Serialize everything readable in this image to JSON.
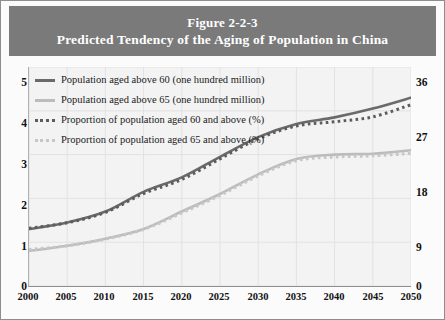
{
  "figure": {
    "number": "Figure 2-2-3",
    "title": "Predicted Tendency of the Aging of Population in China",
    "banner_color": "#7a7a7a",
    "plot_background": "#f3f3f3"
  },
  "legend": {
    "position": "top-left-inside-plot",
    "entries": [
      {
        "label": "Population aged above 60 (one hundred million)",
        "style": "solid",
        "color": "#6a6a6a",
        "axis": "left"
      },
      {
        "label": "Population aged above 65 (one hundred million)",
        "style": "solid",
        "color": "#bcbcbc",
        "axis": "left"
      },
      {
        "label": "Proportion of population aged 60 and above (%)",
        "style": "dotted",
        "color": "#5c5c5c",
        "axis": "right"
      },
      {
        "label": "Proportion of population aged 65 and above (%)",
        "style": "dotted",
        "color": "#c6c6c6",
        "axis": "right"
      }
    ]
  },
  "axes": {
    "x_ticks": [
      "2000",
      "2005",
      "2010",
      "2015",
      "2020",
      "2025",
      "2030",
      "2035",
      "2040",
      "2045",
      "2050"
    ],
    "y_left_ticks": [
      "0",
      "1",
      "2",
      "3",
      "4",
      "5"
    ],
    "y_right_ticks": [
      "0",
      "9",
      "18",
      "27",
      "36"
    ],
    "y_left_range": [
      0,
      5
    ],
    "y_right_range": [
      0,
      36
    ],
    "x_range": [
      2000,
      2050
    ],
    "grid": true
  },
  "chart_data": {
    "type": "line",
    "title": "Predicted Tendency of the Aging of Population in China",
    "subtitle": "Figure 2-2-3",
    "xlabel": "",
    "ylabel": "Population (one hundred million)",
    "y2label": "Proportion (%)",
    "xlim": [
      2000,
      2050
    ],
    "ylim": [
      0,
      5
    ],
    "y2lim": [
      0,
      36
    ],
    "grid": true,
    "legend_position": "upper left",
    "x": [
      2000,
      2005,
      2010,
      2015,
      2020,
      2025,
      2030,
      2035,
      2040,
      2045,
      2050
    ],
    "series": [
      {
        "name": "Population aged above 60 (one hundred million)",
        "axis": "left",
        "style": "solid",
        "color": "#6a6a6a",
        "values": [
          1.3,
          1.45,
          1.7,
          2.15,
          2.48,
          2.95,
          3.4,
          3.7,
          3.85,
          4.05,
          4.3
        ]
      },
      {
        "name": "Population aged above 65 (one hundred million)",
        "axis": "left",
        "style": "solid",
        "color": "#bcbcbc",
        "values": [
          0.8,
          0.92,
          1.08,
          1.3,
          1.7,
          2.1,
          2.55,
          2.9,
          3.0,
          3.02,
          3.1
        ]
      },
      {
        "name": "Proportion of population aged 60 and above (%)",
        "axis": "right",
        "style": "dotted",
        "color": "#5c5c5c",
        "values": [
          9.5,
          10.4,
          12.1,
          15.2,
          17.5,
          20.9,
          24.2,
          26.3,
          27.0,
          27.8,
          29.8
        ]
      },
      {
        "name": "Proportion of population aged 65 and above (%)",
        "axis": "right",
        "style": "dotted",
        "color": "#c6c6c6",
        "values": [
          6.0,
          6.6,
          7.7,
          9.3,
          12.0,
          14.9,
          18.1,
          20.6,
          21.2,
          21.4,
          21.8
        ]
      }
    ]
  }
}
